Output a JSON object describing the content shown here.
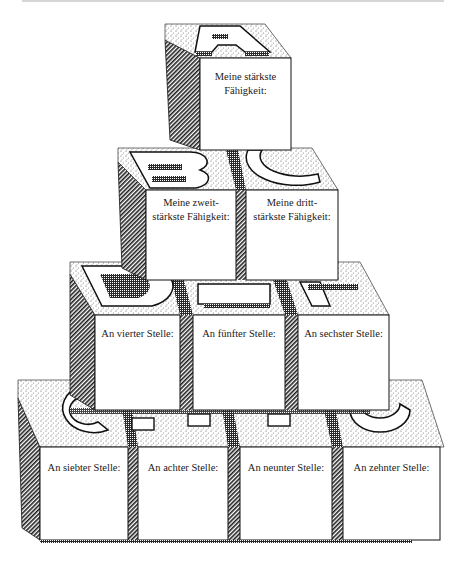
{
  "diagram": {
    "type": "block-pyramid",
    "colors": {
      "background": "#ffffff",
      "face": "#ffffff",
      "outline": "#111111",
      "hatch": "#222222",
      "stipple": "#555555"
    },
    "rows": [
      {
        "row": 1,
        "blocks": [
          {
            "letter": "A",
            "line1": "Meine stärkste",
            "line2": "Fähigkeit:"
          }
        ]
      },
      {
        "row": 2,
        "blocks": [
          {
            "letter": "B",
            "line1": "Meine zweit-",
            "line2": "stärkste Fähigkeit:"
          },
          {
            "letter": "C",
            "line1": "Meine dritt-",
            "line2": "stärkste Fähigkeit:"
          }
        ]
      },
      {
        "row": 3,
        "blocks": [
          {
            "letter": "D",
            "line1": "An vierter Stelle:"
          },
          {
            "letter": "E",
            "line1": "An fünfter Stelle:"
          },
          {
            "letter": "F",
            "line1": "An sechster Stelle:"
          }
        ]
      },
      {
        "row": 4,
        "blocks": [
          {
            "letter": "G",
            "line1": "An siebter Stelle:"
          },
          {
            "letter": "H",
            "line1": "An achter Stelle:"
          },
          {
            "letter": "I",
            "line1": "An neunter Stelle:"
          },
          {
            "letter": "J",
            "line1": "An zehnter Stelle:"
          }
        ]
      }
    ]
  }
}
